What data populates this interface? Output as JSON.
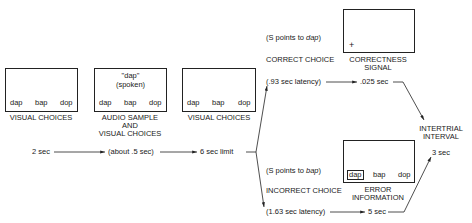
{
  "stage1": {
    "choices": [
      "dap",
      "bap",
      "dop"
    ],
    "label": "VISUAL CHOICES"
  },
  "stage2": {
    "spoken_word": "\"dap\"",
    "spoken_note": "(spoken)",
    "choices": [
      "dap",
      "bap",
      "dop"
    ],
    "label_lines": [
      "AUDIO SAMPLE",
      "AND",
      "VISUAL CHOICES"
    ]
  },
  "stage3": {
    "choices": [
      "dap",
      "bap",
      "dop"
    ],
    "label": "VISUAL CHOICES"
  },
  "timeline": {
    "t1": "2 sec",
    "t2": "(about .5 sec)",
    "t3": "6 sec limit"
  },
  "correct": {
    "note_prefix": "(S points to ",
    "note_word": "dap",
    "note_suffix": ")",
    "label": "CORRECT CHOICE",
    "latency": "(.93 sec latency)",
    "duration": ".025 sec",
    "signal_symbol": "+",
    "signal_label_lines": [
      "CORRECTNESS",
      "SIGNAL"
    ]
  },
  "incorrect": {
    "note_prefix": "(S points to ",
    "note_word": "bap",
    "note_suffix": ")",
    "label": "INCORRECT CHOICE",
    "latency": "(1.63 sec latency)",
    "duration": "5 sec",
    "choices": [
      "dap",
      "bap",
      "dop"
    ],
    "error_label_lines": [
      "ERROR",
      "INFORMATION"
    ]
  },
  "intertrial": {
    "label_lines": [
      "INTERTRIAL",
      "INTERVAL"
    ],
    "duration": "3 sec"
  }
}
